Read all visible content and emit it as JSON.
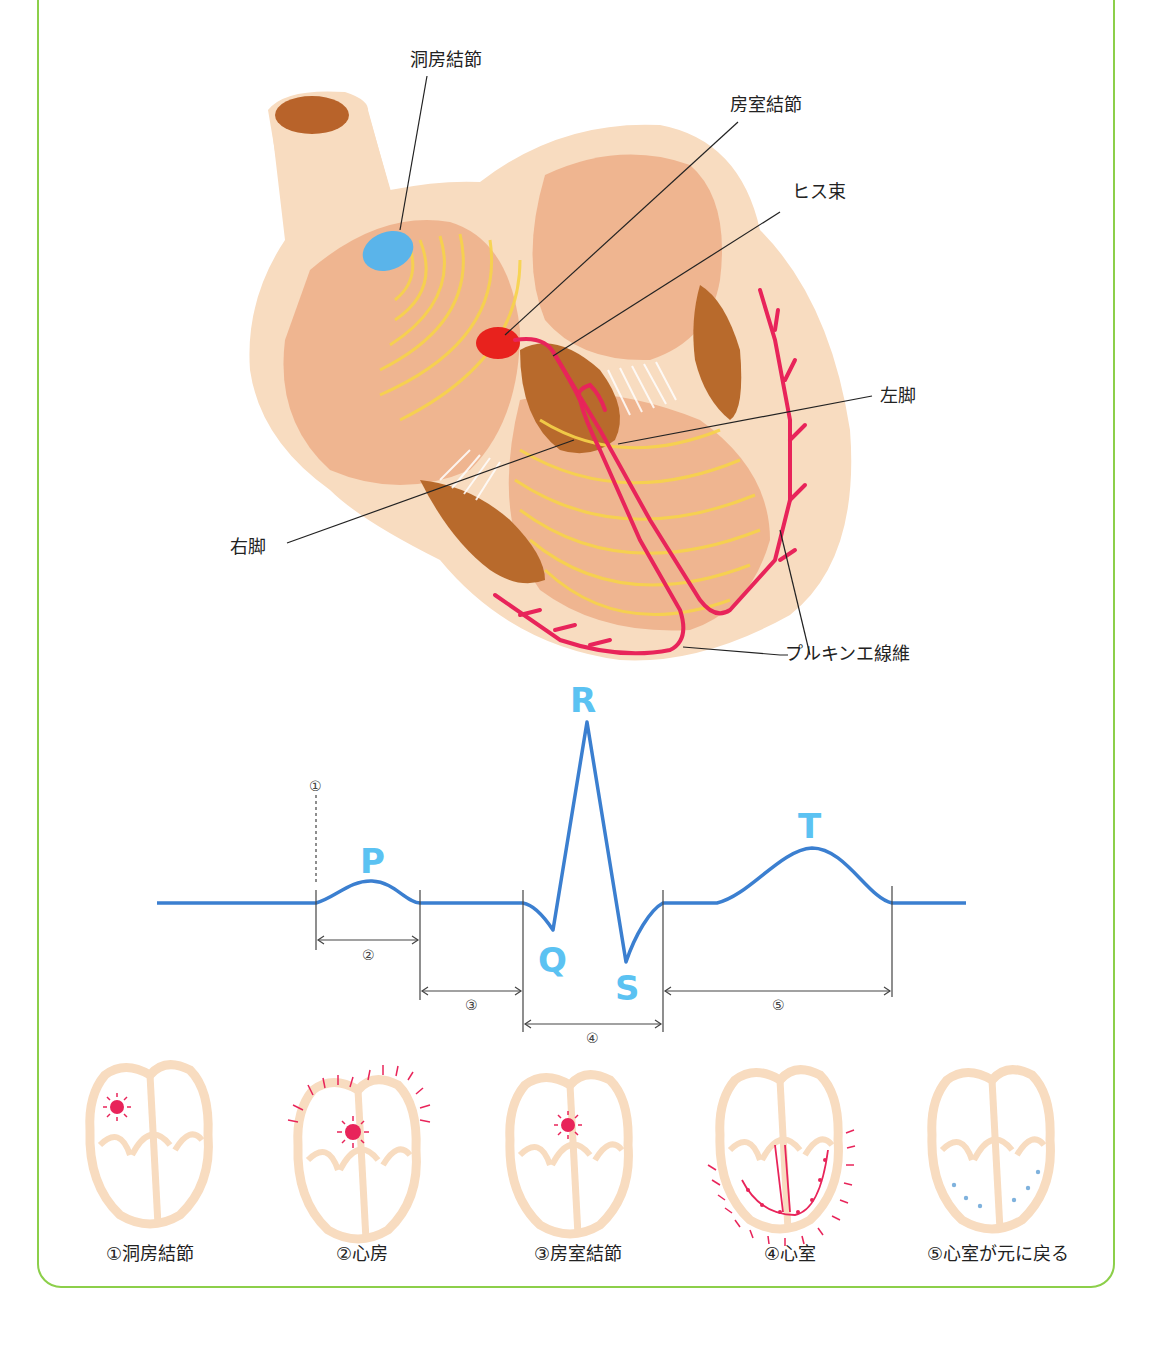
{
  "heart_labels": {
    "sa_node": "洞房結節",
    "av_node": "房室結節",
    "his_bundle": "ヒス束",
    "left_bundle": "左脚",
    "right_bundle": "右脚",
    "purkinje": "プルキンエ線維"
  },
  "ecg": {
    "waves": {
      "P": "P",
      "Q": "Q",
      "R": "R",
      "S": "S",
      "T": "T"
    },
    "markers": {
      "m1": "①",
      "m2": "②",
      "m3": "③",
      "m4": "④",
      "m5": "⑤"
    }
  },
  "steps": [
    {
      "label": "①洞房結節"
    },
    {
      "label": "②心房"
    },
    {
      "label": "③房室結節"
    },
    {
      "label": "④心室"
    },
    {
      "label": "⑤心室が元に戻る"
    }
  ],
  "colors": {
    "frame": "#8ccf4a",
    "heart_outer": "#f8dcc0",
    "heart_inner": "#efb590",
    "muscle": "#b86a2c",
    "sa_node": "#5ab4ea",
    "av_node": "#e8221d",
    "conduction": "#e8245a",
    "wave": "#f7d44a",
    "ecg_line": "#3b7fd0",
    "ecg_letters": "#5bc2f2"
  }
}
